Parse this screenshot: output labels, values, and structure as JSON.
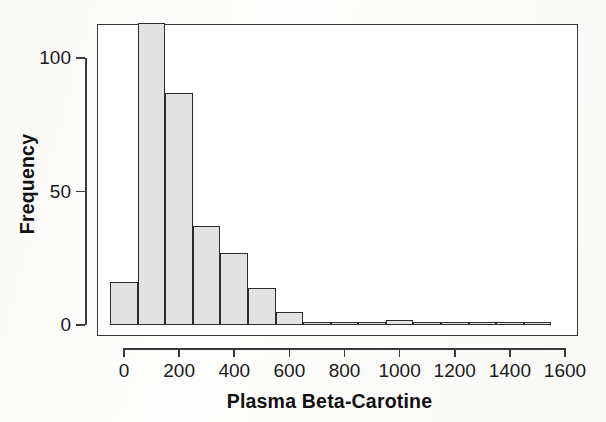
{
  "chart_data": {
    "type": "bar",
    "title": "",
    "subtitle": "",
    "xlabel": "Plasma Beta-Carotine",
    "ylabel": "Frequency",
    "grid": false,
    "legend": null,
    "bin_width": 100,
    "xlim": [
      -50,
      1600
    ],
    "ylim": [
      0,
      115
    ],
    "xticks": [
      0,
      200,
      400,
      600,
      800,
      1000,
      1200,
      1400,
      1600
    ],
    "xtick_labels": [
      "0",
      "200",
      "400",
      "600",
      "800",
      "1000",
      "1200",
      "1400",
      "1600"
    ],
    "yticks": [
      0,
      50,
      100
    ],
    "ytick_labels": [
      "0",
      "50",
      "100"
    ],
    "bin_edges": [
      -50,
      50,
      150,
      250,
      350,
      450,
      550,
      650,
      750,
      850,
      950,
      1050,
      1150,
      1250,
      1350,
      1450,
      1550
    ],
    "bin_centers": [
      0,
      100,
      200,
      300,
      400,
      500,
      600,
      700,
      800,
      900,
      1000,
      1100,
      1200,
      1300,
      1400,
      1500
    ],
    "categories": [
      "0",
      "100",
      "200",
      "300",
      "400",
      "500",
      "600",
      "700",
      "800",
      "900",
      "1000",
      "1100",
      "1200",
      "1300",
      "1400",
      "1500"
    ],
    "values": [
      16,
      113,
      87,
      37,
      27,
      14,
      5,
      0,
      1,
      1,
      2,
      1,
      1,
      1,
      0,
      1
    ],
    "bar_fill_color": "#e2e2e2",
    "bar_edge_color": "#2c2c2c",
    "axis_color": "#3a3a3a",
    "background_color": "#ffffff"
  },
  "figure": {
    "axis_label_x": "Plasma Beta-Carotine",
    "axis_label_y": "Frequency"
  }
}
